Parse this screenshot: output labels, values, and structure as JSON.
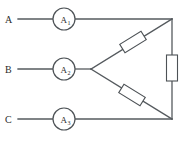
{
  "diagram": {
    "type": "electrical-schematic",
    "colors": {
      "wire": "#555a5e",
      "component_outline": "#4d5256",
      "background": "#ffffff",
      "label_text": "#2b2b2b"
    },
    "terminals": [
      {
        "id": "A",
        "label": "A",
        "x": 8,
        "y": 19,
        "line_y": 19
      },
      {
        "id": "B",
        "label": "B",
        "x": 8,
        "y": 69,
        "line_y": 69
      },
      {
        "id": "C",
        "label": "C",
        "x": 8,
        "y": 119,
        "line_y": 119
      }
    ],
    "meters": [
      {
        "id": "A1",
        "symbol": "A",
        "subscript": "1",
        "cx": 64,
        "cy": 19,
        "r": 11,
        "kind": "ammeter"
      },
      {
        "id": "A2",
        "symbol": "A",
        "subscript": "2",
        "cx": 64,
        "cy": 69,
        "r": 11,
        "kind": "ammeter"
      },
      {
        "id": "A3",
        "symbol": "A",
        "subscript": "3",
        "cx": 64,
        "cy": 119,
        "r": 11,
        "kind": "ammeter"
      }
    ],
    "nodes": {
      "top_right_corner": {
        "x": 172,
        "y": 17
      },
      "bottom_right_corner": {
        "x": 172,
        "y": 119
      },
      "center_junction": {
        "x": 91,
        "y": 69
      }
    },
    "resistors": [
      {
        "id": "R-upper",
        "orientation": "diagonal-up",
        "cx": 133,
        "cy": 42,
        "length": 23,
        "width": 10,
        "angle": -40
      },
      {
        "id": "R-lower",
        "orientation": "diagonal-down",
        "cx": 132,
        "cy": 95,
        "length": 23,
        "width": 10,
        "angle": 38
      },
      {
        "id": "R-right",
        "orientation": "vertical",
        "cx": 172,
        "cy": 68,
        "length": 25,
        "width": 10,
        "angle": 90
      }
    ],
    "wires": [
      {
        "id": "line-a",
        "from": "terminal-A",
        "to": "top-right-corner",
        "path": "horizontal"
      },
      {
        "id": "line-b",
        "from": "terminal-B",
        "to": "center-junction",
        "path": "horizontal"
      },
      {
        "id": "line-c",
        "from": "terminal-C",
        "to": "bottom-right-corner",
        "path": "horizontal"
      },
      {
        "id": "branch-upper",
        "from": "center-junction",
        "to": "top-right-corner",
        "path": "diagonal"
      },
      {
        "id": "branch-lower",
        "from": "center-junction",
        "to": "bottom-right-corner",
        "path": "diagonal"
      },
      {
        "id": "right-rail",
        "from": "top-right-corner",
        "to": "bottom-right-corner",
        "path": "vertical"
      }
    ]
  }
}
